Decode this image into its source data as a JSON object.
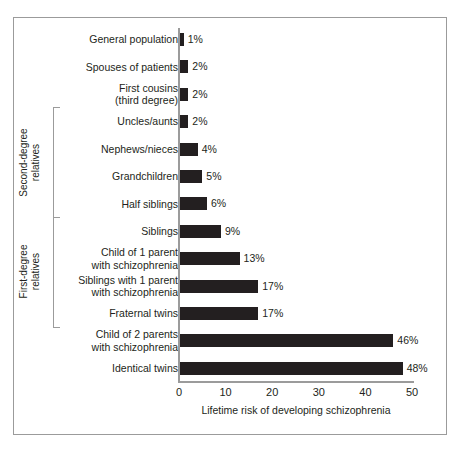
{
  "figure": {
    "background_color": "#ffffff",
    "frame_color": "#9b9b9b",
    "bar_color": "#231f20",
    "text_color": "#231f20"
  },
  "chart_data": {
    "type": "bar",
    "orientation": "horizontal",
    "title": "",
    "xlabel": "Lifetime risk of developing schizophrenia",
    "ylabel": "",
    "xlim": [
      0,
      50
    ],
    "xticks": [
      0,
      10,
      20,
      30,
      40,
      50
    ],
    "xtick_labels": [
      "0",
      "10",
      "20",
      "30",
      "40",
      "50"
    ],
    "grid": false,
    "legend": false,
    "value_suffix": "%",
    "categories": [
      "General population",
      "Spouses of patients",
      "First cousins\n(third degree)",
      "Uncles/aunts",
      "Nephews/nieces",
      "Grandchildren",
      "Half siblings",
      "Siblings",
      "Child of 1 parent\nwith schizophrenia",
      "Siblings with 1 parent\nwith schizophrenia",
      "Fraternal twins",
      "Child of 2 parents\nwith schizophrenia",
      "Identical twins"
    ],
    "values": [
      1,
      2,
      2,
      2,
      4,
      5,
      6,
      9,
      13,
      17,
      17,
      46,
      48
    ],
    "value_labels": [
      "1%",
      "2%",
      "2%",
      "2%",
      "4%",
      "5%",
      "6%",
      "9%",
      "13%",
      "17%",
      "17%",
      "46%",
      "48%"
    ],
    "groups": [
      {
        "label": "Second-degree\nrelatives",
        "first_index": 3,
        "last_index": 6
      },
      {
        "label": "First-degree\nrelatives",
        "first_index": 7,
        "last_index": 10
      }
    ]
  }
}
